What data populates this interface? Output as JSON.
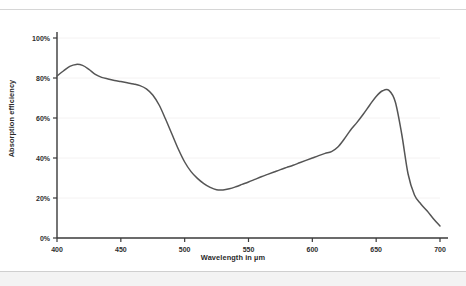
{
  "chart_data": {
    "type": "line",
    "title": "",
    "xlabel": "Wavelength in µm",
    "ylabel": "Absorption efficiency",
    "xlim": [
      400,
      700
    ],
    "ylim": [
      0,
      100
    ],
    "grid": "faint-horizontal",
    "legend": "none",
    "line_color": "#555555",
    "xticks": [
      400,
      450,
      500,
      550,
      600,
      650,
      700
    ],
    "xtick_labels": [
      "400",
      "450",
      "500",
      "550",
      "600",
      "650",
      "700"
    ],
    "yticks": [
      0,
      20,
      40,
      60,
      80,
      100
    ],
    "ytick_labels": [
      "0%",
      "20%",
      "40%",
      "60%",
      "80%",
      "100%"
    ],
    "series": [
      {
        "name": "Absorption efficiency",
        "x": [
          400,
          405,
          410,
          415,
          420,
          425,
          430,
          435,
          440,
          445,
          450,
          455,
          460,
          465,
          470,
          475,
          480,
          485,
          490,
          495,
          500,
          505,
          510,
          515,
          520,
          525,
          530,
          535,
          540,
          545,
          550,
          555,
          560,
          565,
          570,
          575,
          580,
          585,
          590,
          595,
          600,
          605,
          610,
          615,
          620,
          625,
          630,
          635,
          640,
          645,
          650,
          655,
          660,
          665,
          670,
          675,
          680,
          685,
          690,
          695,
          700
        ],
        "y": [
          81,
          83.5,
          85.8,
          86.8,
          86.3,
          84.3,
          81.8,
          80.3,
          79.5,
          78.8,
          78.2,
          77.6,
          77.0,
          76.2,
          74.6,
          71.5,
          66.5,
          59.5,
          52.0,
          44.5,
          38.0,
          33.2,
          29.8,
          27.2,
          25.3,
          24.1,
          24.0,
          24.6,
          25.6,
          26.8,
          28.0,
          29.3,
          30.6,
          31.8,
          33.0,
          34.2,
          35.3,
          36.4,
          37.6,
          38.8,
          40.0,
          41.2,
          42.3,
          43.2,
          45.5,
          49.5,
          54.0,
          57.8,
          62.0,
          66.5,
          70.8,
          73.6,
          73.8,
          68.0,
          52.0,
          32.0,
          21.5,
          17.0,
          13.5,
          9.5,
          6.0
        ]
      }
    ]
  }
}
